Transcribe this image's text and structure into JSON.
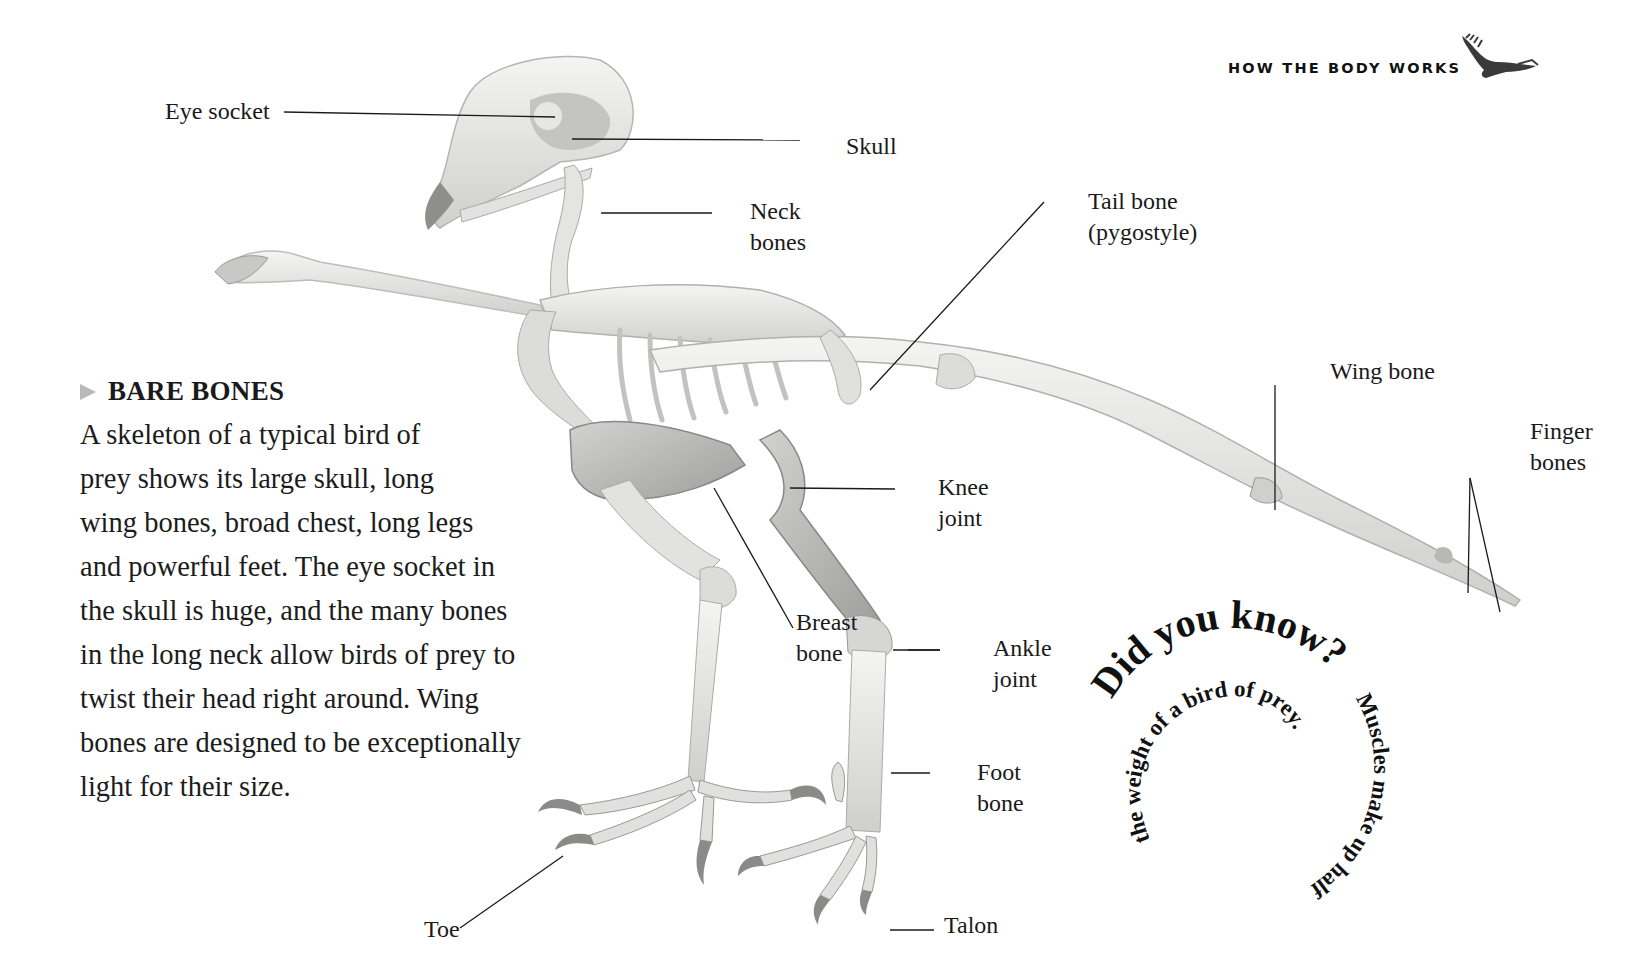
{
  "header": {
    "section_title": "HOW THE BODY WORKS",
    "icon": "eagle-icon"
  },
  "article": {
    "title": "BARE BONES",
    "title_marker": "triangle-bullet-icon",
    "body_lines": [
      "A skeleton of a typical bird of",
      "prey shows its large skull, long",
      "wing bones, broad chest, long legs",
      "and powerful feet. The eye socket in",
      "the skull is huge, and the many bones",
      "in the long neck allow birds of prey to",
      "twist their head right around. Wing",
      "bones are designed to be exceptionally",
      "light for their size."
    ]
  },
  "figure": {
    "labels": {
      "eye_socket": "Eye socket",
      "skull": "Skull",
      "neck_bones": [
        "Neck",
        "bones"
      ],
      "tail_bone": [
        "Tail bone",
        "(pygostyle)"
      ],
      "wing_bone": "Wing bone",
      "finger_bones": [
        "Finger",
        "bones"
      ],
      "knee_joint": [
        "Knee",
        "joint"
      ],
      "breast_bone": [
        "Breast",
        "bone"
      ],
      "ankle_joint": [
        "Ankle",
        "joint"
      ],
      "foot_bone": [
        "Foot",
        "bone"
      ],
      "toe": "Toe",
      "talon": "Talon"
    }
  },
  "did_you_know": {
    "heading": "Did you know?",
    "fact": "Muscles make up half the weight of a bird of prey."
  },
  "colors": {
    "text": "#1a1a1a",
    "bone_light": "#eeeeec",
    "bone_mid": "#d6d6d4",
    "bone_shadow": "#a8a8a6",
    "bullet": "#b8b8b8",
    "background": "#ffffff"
  }
}
